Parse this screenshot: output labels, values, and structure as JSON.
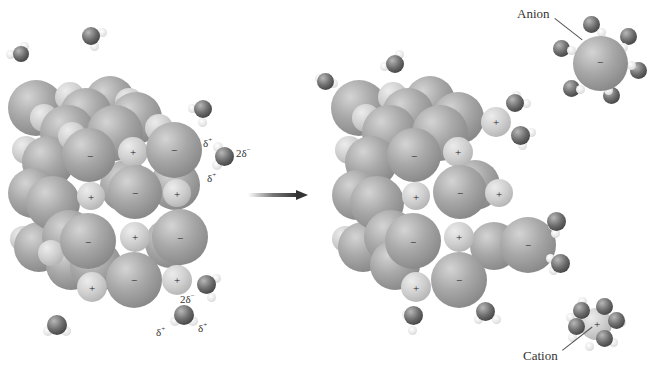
{
  "diagram": {
    "labels": {
      "anion": "Anion",
      "cation": "Cation"
    },
    "partial_charges": {
      "delta_plus": "δ",
      "delta_plus_sup": "+",
      "two_delta_minus": "2δ",
      "two_delta_minus_sup": "−"
    },
    "ion_signs": {
      "anion": "−",
      "cation": "+"
    },
    "arrow": {
      "direction": "right",
      "color": "#333333"
    },
    "colors": {
      "anion_sphere": "#9a9a9a",
      "cation_sphere": "#c8c8c8",
      "water_oxygen": "#4a4a4a",
      "water_hydrogen": "#e8e8e8",
      "background": "#ffffff"
    },
    "panels": [
      {
        "name": "before",
        "description": "Intact ionic crystal lattice surrounded by polar water molecules"
      },
      {
        "name": "after",
        "description": "Ions leaving lattice, surrounded by hydration shells"
      }
    ]
  }
}
